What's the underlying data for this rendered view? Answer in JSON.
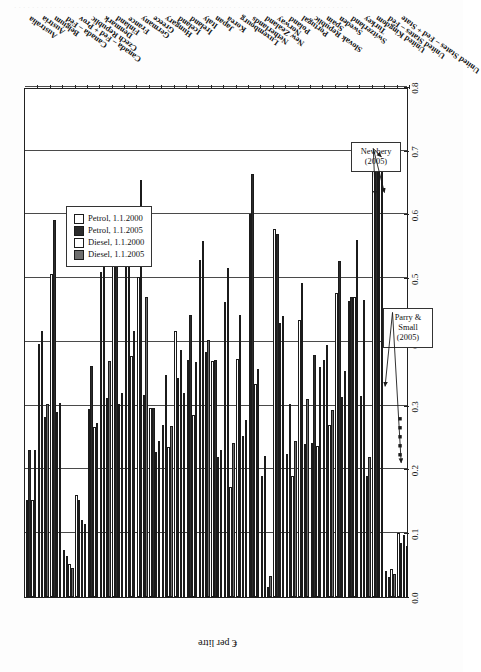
{
  "page": {
    "bleed_text": "· · · · · · · · · · · · · · · · · · · · · · · · · · · · · · · · · · · · · · · · · · · · · · · · · · · · · · · · · · · · · · · · · · · · · · · · · · · ·"
  },
  "legend": {
    "items": [
      {
        "label": "Petrol, 1.1.2000",
        "color": "#ffffff",
        "key": "petrol_2000"
      },
      {
        "label": "Petrol, 1.1.2005",
        "color": "#2b2b2b",
        "key": "petrol_2005"
      },
      {
        "label": "Diesel, 1.1.2000",
        "color": "#ffffff",
        "key": "diesel_2000"
      },
      {
        "label": "Diesel, 1.1.2005",
        "color": "#6e6e6e",
        "key": "diesel_2005"
      }
    ]
  },
  "annotations": [
    {
      "id": "newbery",
      "text": "Newbery\n(2005)",
      "line1": "Newbery",
      "line2": "(2005)"
    },
    {
      "id": "parry_small",
      "text": "Parry &\nSmall\n(2005)",
      "line1": "Parry &",
      "line2": "Small",
      "line3": "(2005)"
    }
  ],
  "chart_data": {
    "type": "bar",
    "orientation": "horizontal",
    "title": "",
    "xlabel": "",
    "ylabel": "€ per litre",
    "ylim": [
      0.0,
      0.8
    ],
    "yticks": [
      "0.0",
      "0.1",
      "0.2",
      "0.3",
      "0.4",
      "0.5",
      "0.6",
      "0.7",
      "0.8"
    ],
    "grid": "vertical",
    "legend_position": "inside-lower-left",
    "categories": [
      "Australia",
      "Austria",
      "Belgium",
      "Canada – Fed",
      "Canada – Fed + Prov",
      "Czech Republic",
      "Denmark",
      "Finland",
      "France",
      "Germany",
      "Greece",
      "Hungary",
      "Iceland",
      "Ireland",
      "Italy",
      "Japan",
      "Korea",
      "Luxembourg",
      "Netherlands",
      "New Zealand",
      "Norway",
      "Poland",
      "Portugal",
      "Slovak Republic",
      "Spain",
      "Sweden",
      "Switzerland",
      "Turkey",
      "United Kingdom",
      "United States – Fed",
      "United States – Fed + State"
    ],
    "series": [
      {
        "name": "Petrol, 1.1.2000",
        "color": "#ffffff",
        "values": [
          0.152,
          0.397,
          0.507,
          0.073,
          0.16,
          0.295,
          0.51,
          0.541,
          0.587,
          0.502,
          0.296,
          0.27,
          0.418,
          0.372,
          0.528,
          0.37,
          0.462,
          0.373,
          0.6,
          0.19,
          0.578,
          0.225,
          0.435,
          0.242,
          0.372,
          0.477,
          0.465,
          0.315,
          0.69,
          0.04,
          0.1
        ]
      },
      {
        "name": "Petrol, 1.1.2005",
        "color": "#2b2b2b",
        "values": [
          0.23,
          0.417,
          0.592,
          0.065,
          0.152,
          0.362,
          0.528,
          0.587,
          0.589,
          0.654,
          0.296,
          0.348,
          0.343,
          0.443,
          0.559,
          0.371,
          0.516,
          0.442,
          0.663,
          0.221,
          0.57,
          0.303,
          0.492,
          0.38,
          0.396,
          0.527,
          0.47,
          0.466,
          0.706,
          0.032,
          0.084
        ]
      },
      {
        "name": "Diesel, 1.1.2000",
        "color": "#ffffff",
        "values": [
          0.152,
          0.282,
          0.29,
          0.052,
          0.12,
          0.266,
          0.312,
          0.303,
          0.378,
          0.317,
          0.228,
          0.235,
          0.388,
          0.285,
          0.385,
          0.22,
          0.172,
          0.253,
          0.334,
          0.015,
          0.43,
          0.19,
          0.24,
          0.237,
          0.27,
          0.313,
          0.47,
          0.19,
          0.69,
          0.044,
          0.098
        ]
      },
      {
        "name": "Diesel, 1.1.2005",
        "color": "#6e6e6e",
        "values": [
          0.23,
          0.302,
          0.305,
          0.045,
          0.115,
          0.273,
          0.37,
          0.32,
          0.417,
          0.47,
          0.245,
          0.268,
          0.32,
          0.368,
          0.403,
          0.23,
          0.242,
          0.278,
          0.358,
          0.033,
          0.44,
          0.245,
          0.31,
          0.36,
          0.294,
          0.355,
          0.56,
          0.22,
          0.706,
          0.036,
          0.08
        ]
      }
    ]
  }
}
